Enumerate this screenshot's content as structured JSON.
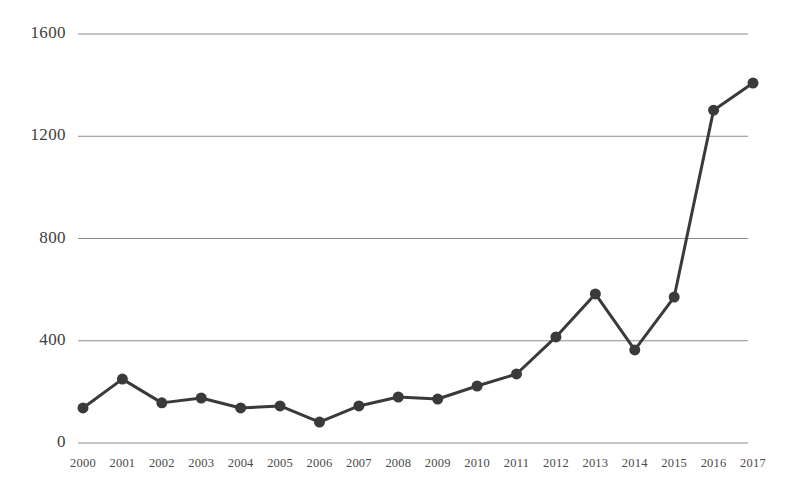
{
  "chart_data": {
    "type": "line",
    "title": "",
    "subtitle": "",
    "xlabel": "",
    "ylabel": "",
    "categories": [
      "2000",
      "2001",
      "2002",
      "2003",
      "2004",
      "2005",
      "2006",
      "2007",
      "2008",
      "2009",
      "2010",
      "2011",
      "2012",
      "2013",
      "2014",
      "2015",
      "2016",
      "2017"
    ],
    "values": [
      137,
      250,
      157,
      176,
      137,
      145,
      82,
      145,
      180,
      172,
      223,
      270,
      415,
      583,
      364,
      571,
      1302,
      1408
    ],
    "series": [
      {
        "name": "",
        "values": [
          137,
          250,
          157,
          176,
          137,
          145,
          82,
          145,
          180,
          172,
          223,
          270,
          415,
          583,
          364,
          571,
          1302,
          1408
        ]
      }
    ],
    "x": [
      "2000",
      "2001",
      "2002",
      "2003",
      "2004",
      "2005",
      "2006",
      "2007",
      "2008",
      "2009",
      "2010",
      "2011",
      "2012",
      "2013",
      "2014",
      "2015",
      "2016",
      "2017"
    ],
    "ylim": [
      0,
      1600
    ],
    "y_ticks": [
      "0",
      "400",
      "800",
      "1200",
      "1600"
    ],
    "y_tick_values": [
      0,
      400,
      800,
      1200,
      1600
    ],
    "x_tick_labels": [
      "2000",
      "2001",
      "2002",
      "2003",
      "2004",
      "2005",
      "2006",
      "2007",
      "2008",
      "2009",
      "2010",
      "2011",
      "2012",
      "2013",
      "2014",
      "2015",
      "2016",
      "2017"
    ],
    "grid": true,
    "grid_axis": "y",
    "legend": false,
    "legend_position": "none",
    "marker": "circle",
    "marker_size": 11,
    "line_width": 3,
    "line_color": "#3a3a3a",
    "marker_color": "#3a3a3a",
    "grid_color": "#8c8c8c",
    "background_color": "#ffffff",
    "annotations": []
  },
  "axes": {
    "y_labels": [
      "1600",
      "1200",
      "800",
      "400",
      "0"
    ],
    "x_labels": [
      "2000",
      "2001",
      "2002",
      "2003",
      "2004",
      "2005",
      "2006",
      "2007",
      "2008",
      "2009",
      "2010",
      "2011",
      "2012",
      "2013",
      "2014",
      "2015",
      "2016",
      "2017"
    ]
  }
}
